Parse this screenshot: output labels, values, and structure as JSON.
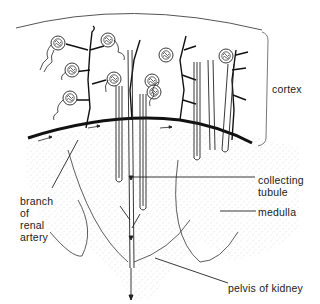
{
  "figure": {
    "labels": {
      "cortex": "cortex",
      "collecting_tubule": "collecting\ntubule",
      "collecting_line1": "collecting",
      "collecting_line2": "tubule",
      "medulla": "medulla",
      "branch_line1": "branch",
      "branch_line2": "of",
      "branch_line3": "renal",
      "branch_line4": "artery",
      "pelvis": "pelvis of kidney"
    },
    "colors": {
      "ink": "#1a1a1a",
      "stipple": "#bdbdbd",
      "background": "#ffffff"
    }
  }
}
